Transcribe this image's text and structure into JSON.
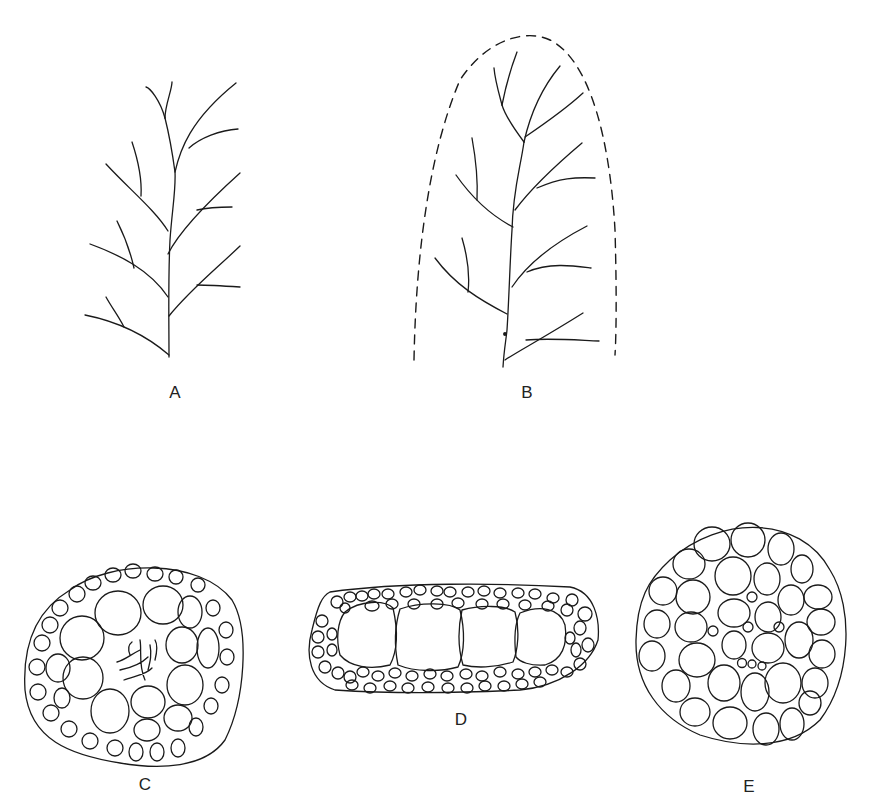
{
  "figure": {
    "panels": [
      {
        "id": "A",
        "label": "A",
        "description": "branching filament system (pinnate)"
      },
      {
        "id": "B",
        "label": "B",
        "description": "branching filament system within dashed outline"
      },
      {
        "id": "C",
        "label": "C",
        "description": "cross section, round, small peripheral cells, large inner cells, central filaments"
      },
      {
        "id": "D",
        "label": "D",
        "description": "cross section, elongated, four large central cells surrounded by small cells"
      },
      {
        "id": "E",
        "label": "E",
        "description": "cross section, round, many large cells with few small central cells"
      }
    ]
  },
  "colors": {
    "line": "#1a1a1a",
    "background": "#ffffff"
  }
}
